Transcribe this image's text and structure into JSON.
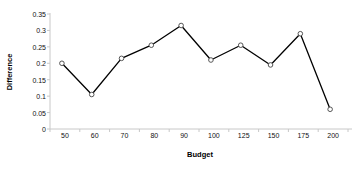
{
  "chart_data": {
    "type": "line",
    "title": "",
    "xlabel": "Budget",
    "ylabel": "Difference",
    "categories": [
      "50",
      "60",
      "70",
      "80",
      "90",
      "100",
      "125",
      "150",
      "175",
      "200"
    ],
    "values": [
      0.2,
      0.105,
      0.215,
      0.255,
      0.315,
      0.21,
      0.255,
      0.195,
      0.29,
      0.06
    ],
    "series": [
      {
        "name": "Difference",
        "values": [
          0.2,
          0.105,
          0.215,
          0.255,
          0.315,
          0.21,
          0.255,
          0.195,
          0.29,
          0.06
        ]
      }
    ],
    "ylim": [
      0,
      0.35
    ],
    "yticks": [
      0,
      0.05,
      0.1,
      0.15,
      0.2,
      0.25,
      0.3,
      0.35
    ],
    "ytick_labels": [
      "0",
      "0.05",
      "0.1",
      "0.15",
      "0.2",
      "0.25",
      "0.3",
      "0.35"
    ],
    "xtick_labels": [
      "50",
      "60",
      "70",
      "80",
      "90",
      "100",
      "125",
      "150",
      "175",
      "200"
    ],
    "grid": false,
    "legend": "none",
    "marker": "open-circle",
    "line_color": "#000000",
    "marker_fill": "#ffffff",
    "marker_edge": "#555555",
    "axis_color": "#c8c8c8",
    "text_color": "#111111"
  },
  "axis_titles": {
    "y": "Difference",
    "x": "Budget"
  }
}
